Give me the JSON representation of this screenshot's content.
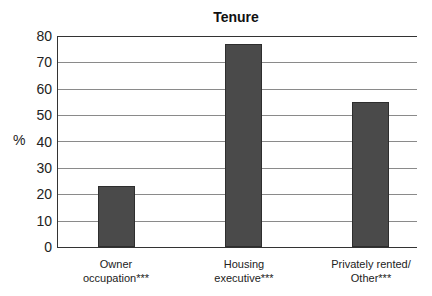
{
  "chart_data": {
    "type": "bar",
    "title": "Tenure",
    "xlabel": "",
    "ylabel": "%",
    "ylim": [
      0,
      80
    ],
    "yticks": [
      0,
      10,
      20,
      30,
      40,
      50,
      60,
      70,
      80
    ],
    "grid": true,
    "legend": null,
    "categories": [
      "Owner occupation***",
      "Housing executive***",
      "Privately rented/ Other***"
    ],
    "category_lines": [
      [
        "Owner",
        "occupation***"
      ],
      [
        "Housing",
        "executive***"
      ],
      [
        "Privately rented/",
        "Other***"
      ]
    ],
    "values": [
      23,
      77,
      55
    ],
    "bar_color": "#4a4a4a"
  },
  "labels": {
    "title": "Tenure",
    "ylabel": "%",
    "yticks": [
      "0",
      "10",
      "20",
      "30",
      "40",
      "50",
      "60",
      "70",
      "80"
    ],
    "x0_line1": "Owner",
    "x0_line2": "occupation***",
    "x1_line1": "Housing",
    "x1_line2": "executive***",
    "x2_line1": "Privately rented/",
    "x2_line2": "Other***"
  }
}
